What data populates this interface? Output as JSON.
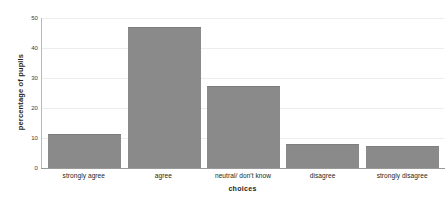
{
  "chart_data": {
    "type": "bar",
    "title": "",
    "subtitle": "",
    "categories": [
      "strongly agree",
      "agree",
      "neutral/ don't know",
      "disagree",
      "strongly disagree"
    ],
    "values": [
      11.5,
      47,
      27.5,
      8,
      7.5
    ],
    "xlabel": "choices",
    "ylabel": "percentage of pupils",
    "ylim": [
      0,
      50
    ],
    "yticks": [
      0,
      10,
      20,
      30,
      40,
      50
    ],
    "ytick_labels": [
      "0",
      "10",
      "20",
      "30",
      "40",
      "50"
    ],
    "grid": "horizontal",
    "legend": "none",
    "bar_color": "#8a8a8a",
    "gridline_color": "#ededed",
    "axis_color": "#9a9a9a",
    "background": "#ffffff",
    "annotations": []
  }
}
